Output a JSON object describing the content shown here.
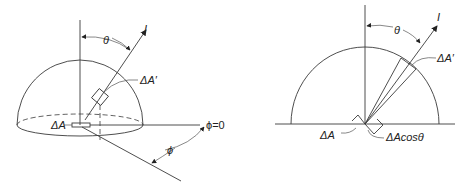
{
  "figure": {
    "left_panel": {
      "description": "Hemisphere over surface element with zenith angle and azimuth angle",
      "labels": {
        "intensity": "I",
        "zenith_angle": "θ",
        "projected_area": "ΔA′",
        "surface_area": "ΔA",
        "azimuth_angle": "ϕ",
        "azimuth_reference": "ϕ=0"
      }
    },
    "right_panel": {
      "description": "Semicircle cross-section showing projected area ΔA cosθ",
      "labels": {
        "intensity": "I",
        "zenith_angle": "θ",
        "projected_area": "ΔA′",
        "surface_area": "ΔA",
        "projected_surface": "ΔAcosθ"
      }
    },
    "colors": {
      "line": "#3a3a3a",
      "text": "#222222",
      "background": "#ffffff"
    }
  }
}
